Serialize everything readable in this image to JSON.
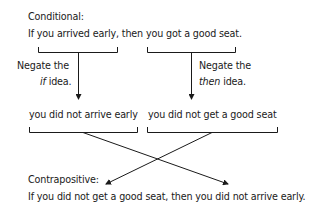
{
  "conditional": {
    "label": "Conditional:",
    "sentence": "If you arrived early, then you got a good seat."
  },
  "negate_left": {
    "line1": "Negate the",
    "italic_word": "if",
    "rest": " idea."
  },
  "negate_right": {
    "line1": "Negate the",
    "italic_word": "then",
    "rest": " idea."
  },
  "negated": {
    "left": "you did not arrive early",
    "right": "you did not get a good seat"
  },
  "contrapositive": {
    "label": "Contrapositive:",
    "sentence": "If you did not get a good seat, then you did not arrive early."
  },
  "colors": {
    "line": "#1a1a1a",
    "text": "#1a1a1a",
    "background": "#ffffff"
  }
}
